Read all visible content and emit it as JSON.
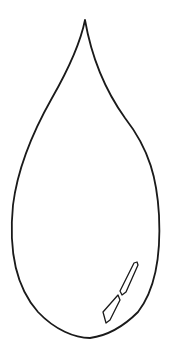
{
  "drawing": {
    "subject": "water-drop",
    "style": "line-art",
    "stroke_color": "#1a1a1a",
    "background_color": "#ffffff"
  }
}
